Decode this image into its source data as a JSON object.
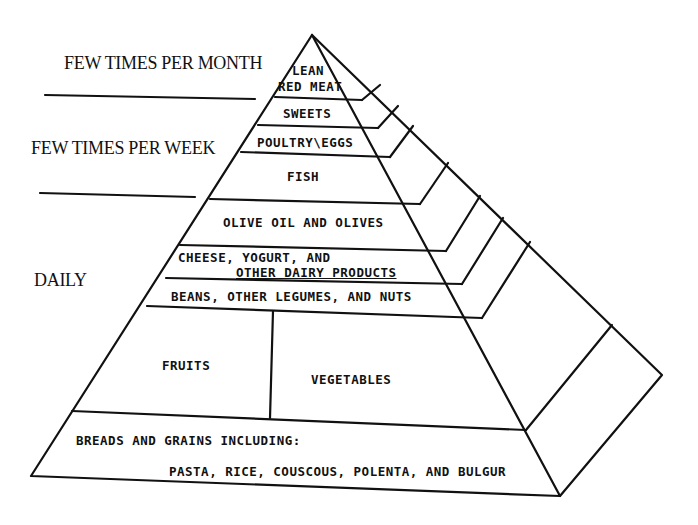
{
  "diagram": {
    "frequency_labels": [
      {
        "id": "month",
        "text": "FEW TIMES PER MONTH"
      },
      {
        "id": "week",
        "text": "FEW TIMES PER WEEK"
      },
      {
        "id": "daily",
        "text": "DAILY"
      }
    ],
    "tiers": [
      {
        "id": "lean-red-meat",
        "lines": [
          "LEAN",
          "RED MEAT"
        ],
        "frequency": "FEW TIMES PER MONTH"
      },
      {
        "id": "sweets",
        "lines": [
          "SWEETS"
        ],
        "frequency": "FEW TIMES PER WEEK"
      },
      {
        "id": "poultry-eggs",
        "lines": [
          "POULTRY\\EGGS"
        ],
        "frequency": "FEW TIMES PER WEEK"
      },
      {
        "id": "fish",
        "lines": [
          "FISH"
        ],
        "frequency": "FEW TIMES PER WEEK"
      },
      {
        "id": "olive-oil",
        "lines": [
          "OLIVE OIL AND OLIVES"
        ],
        "frequency": "DAILY"
      },
      {
        "id": "dairy",
        "lines": [
          "CHEESE, YOGURT, AND",
          "OTHER DAIRY PRODUCTS"
        ],
        "frequency": "DAILY"
      },
      {
        "id": "beans",
        "lines": [
          "BEANS, OTHER LEGUMES, AND NUTS"
        ],
        "frequency": "DAILY"
      },
      {
        "id": "fruits",
        "lines": [
          "FRUITS"
        ],
        "frequency": "DAILY"
      },
      {
        "id": "vegetables",
        "lines": [
          "VEGETABLES"
        ],
        "frequency": "DAILY"
      },
      {
        "id": "breads-grains",
        "lines": [
          "BREADS AND GRAINS INCLUDING:",
          "PASTA, RICE, COUSCOUS, POLENTA, AND BULGUR"
        ],
        "frequency": "DAILY"
      }
    ],
    "colors": {
      "line": "#111111",
      "background": "#ffffff"
    }
  }
}
